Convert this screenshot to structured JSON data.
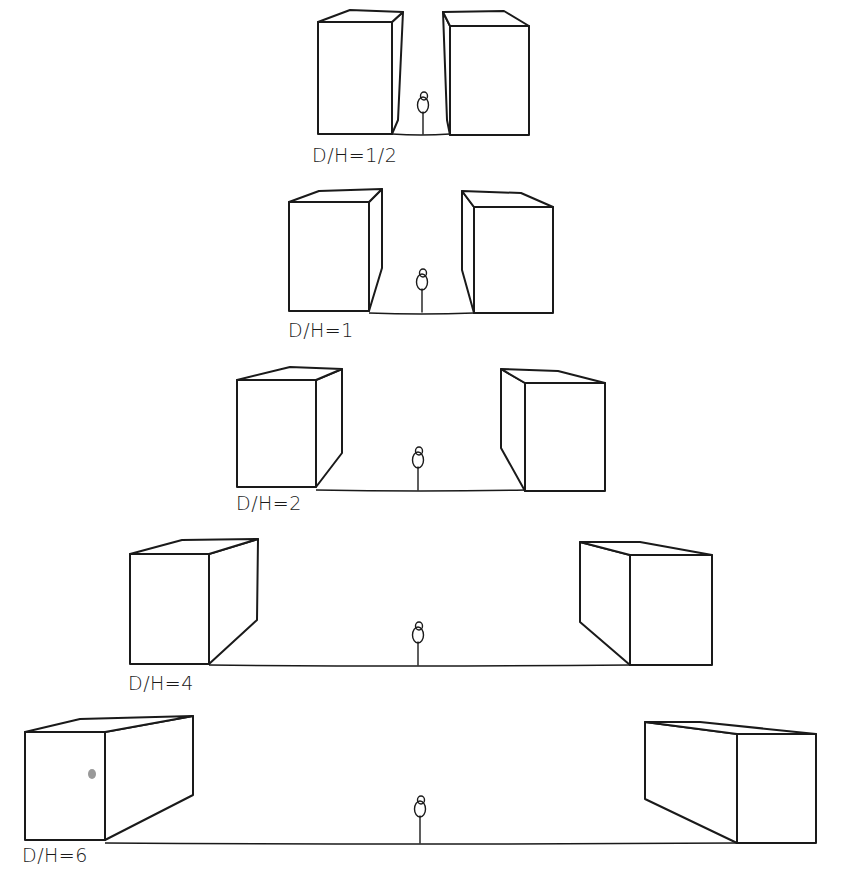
{
  "diagram": {
    "background": "#ffffff",
    "ink": "#1a1a1a",
    "panels": [
      {
        "label": "D/H=1/2",
        "label_pos": [
          312,
          162
        ],
        "ground_y": 134,
        "left_box": {
          "front": [
            318,
            22,
            392,
            134
          ],
          "depth_top": [
            [
              318,
              22
            ],
            [
              350,
              10
            ],
            [
              403,
              12
            ],
            [
              392,
              22
            ]
          ],
          "side": [
            [
              392,
              22
            ],
            [
              403,
              12
            ],
            [
              398,
              120
            ],
            [
              392,
              134
            ]
          ]
        },
        "right_box": {
          "front": [
            450,
            26,
            529,
            135
          ],
          "depth_top": [
            [
              443,
              12
            ],
            [
              504,
              11
            ],
            [
              529,
              26
            ],
            [
              450,
              26
            ]
          ],
          "side": [
            [
              443,
              12
            ],
            [
              450,
              26
            ],
            [
              450,
              135
            ],
            [
              447,
              120
            ]
          ]
        },
        "figure": {
          "x": 423,
          "head_y": 98,
          "foot_y": 134
        }
      },
      {
        "label": "D/H=1",
        "label_pos": [
          288,
          337
        ],
        "ground_y": 313,
        "left_box": {
          "front": [
            289,
            202,
            369,
            311
          ],
          "depth_top": [
            [
              289,
              202
            ],
            [
              319,
              191
            ],
            [
              382,
              189
            ],
            [
              369,
              202
            ]
          ],
          "side": [
            [
              369,
              202
            ],
            [
              382,
              189
            ],
            [
              382,
              268
            ],
            [
              369,
              311
            ]
          ]
        },
        "right_box": {
          "front": [
            474,
            207,
            553,
            313
          ],
          "depth_top": [
            [
              462,
              191
            ],
            [
              521,
              193
            ],
            [
              553,
              207
            ],
            [
              474,
              207
            ]
          ],
          "side": [
            [
              462,
              191
            ],
            [
              474,
              207
            ],
            [
              474,
              313
            ],
            [
              462,
              270
            ]
          ]
        },
        "figure": {
          "x": 422,
          "head_y": 275,
          "foot_y": 312
        }
      },
      {
        "label": "D/H=2",
        "label_pos": [
          236,
          510
        ],
        "ground_y": 490,
        "left_box": {
          "front": [
            237,
            380,
            316,
            487
          ],
          "depth_top": [
            [
              237,
              380
            ],
            [
              290,
              367
            ],
            [
              342,
              369
            ],
            [
              316,
              380
            ]
          ],
          "side": [
            [
              316,
              380
            ],
            [
              342,
              369
            ],
            [
              342,
              453
            ],
            [
              316,
              487
            ]
          ]
        },
        "right_box": {
          "front": [
            525,
            383,
            605,
            491
          ],
          "depth_top": [
            [
              501,
              369
            ],
            [
              558,
              371
            ],
            [
              605,
              383
            ],
            [
              525,
              383
            ]
          ],
          "side": [
            [
              501,
              369
            ],
            [
              525,
              383
            ],
            [
              525,
              491
            ],
            [
              501,
              448
            ]
          ]
        },
        "figure": {
          "x": 418,
          "head_y": 453,
          "foot_y": 490
        }
      },
      {
        "label": "D/H=4",
        "label_pos": [
          128,
          690
        ],
        "ground_y": 665,
        "left_box": {
          "front": [
            130,
            554,
            209,
            664
          ],
          "depth_top": [
            [
              130,
              554
            ],
            [
              182,
              540
            ],
            [
              258,
              539
            ],
            [
              209,
              554
            ]
          ],
          "side": [
            [
              209,
              554
            ],
            [
              258,
              539
            ],
            [
              257,
              620
            ],
            [
              209,
              664
            ]
          ]
        },
        "right_box": {
          "front": [
            630,
            555,
            712,
            665
          ],
          "depth_top": [
            [
              580,
              542
            ],
            [
              640,
              542
            ],
            [
              712,
              555
            ],
            [
              630,
              555
            ]
          ],
          "side": [
            [
              580,
              542
            ],
            [
              630,
              555
            ],
            [
              630,
              665
            ],
            [
              580,
              622
            ]
          ]
        },
        "figure": {
          "x": 418,
          "head_y": 628,
          "foot_y": 665
        }
      },
      {
        "label": "D/H=6",
        "label_pos": [
          22,
          862
        ],
        "ground_y": 843,
        "left_box": {
          "front": [
            25,
            732,
            105,
            840
          ],
          "depth_top": [
            [
              25,
              732
            ],
            [
              80,
              719
            ],
            [
              193,
              716
            ],
            [
              105,
              732
            ]
          ],
          "side": [
            [
              105,
              732
            ],
            [
              193,
              716
            ],
            [
              193,
              795
            ],
            [
              105,
              840
            ]
          ]
        },
        "right_box": {
          "front": [
            737,
            734,
            816,
            843
          ],
          "depth_top": [
            [
              645,
              722
            ],
            [
              700,
              722
            ],
            [
              816,
              734
            ],
            [
              737,
              734
            ]
          ],
          "side": [
            [
              645,
              722
            ],
            [
              737,
              734
            ],
            [
              737,
              843
            ],
            [
              645,
              799
            ]
          ]
        },
        "figure": {
          "x": 420,
          "head_y": 802,
          "foot_y": 843
        },
        "smudge": [
          92,
          774
        ]
      }
    ]
  }
}
